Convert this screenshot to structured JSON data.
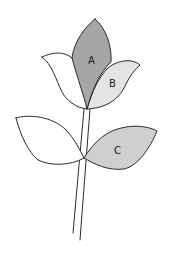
{
  "diagram": {
    "colors": {
      "outline": "#2b2b2b",
      "petal_a_fill": "#a6a6a6",
      "petal_b_fill": "#e4e4e4",
      "leaf_c_fill": "#cfcfcf",
      "unshaded_fill": "#ffffff",
      "background": "#ffffff"
    },
    "parts": [
      {
        "id": "A",
        "label": "A",
        "kind": "petal",
        "shading": "dark gray"
      },
      {
        "id": "B",
        "label": "B",
        "kind": "petal",
        "shading": "light gray"
      },
      {
        "id": "C",
        "label": "C",
        "kind": "leaf",
        "shading": "medium gray"
      },
      {
        "id": "left-petal",
        "label": "",
        "kind": "petal",
        "shading": "none"
      },
      {
        "id": "left-leaf",
        "label": "",
        "kind": "leaf",
        "shading": "none"
      },
      {
        "id": "stem",
        "label": "",
        "kind": "stem",
        "shading": "none"
      }
    ],
    "labels": {
      "a": "A",
      "b": "B",
      "c": "C"
    }
  }
}
